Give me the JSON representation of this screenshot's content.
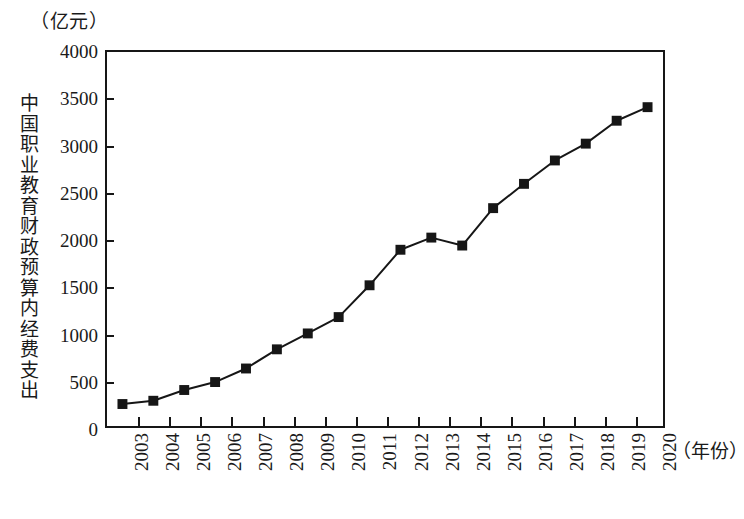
{
  "chart_data": {
    "type": "line",
    "title": "",
    "unit_label": "（亿元）",
    "ylabel": "中国职业教育财政预算内经费支出",
    "xlabel": "（年份）",
    "categories": [
      "2003",
      "2004",
      "2005",
      "2006",
      "2007",
      "2008",
      "2009",
      "2010",
      "2011",
      "2012",
      "2013",
      "2014",
      "2015",
      "2016",
      "2017",
      "2018",
      "2019",
      "2020"
    ],
    "values": [
      235,
      270,
      385,
      470,
      615,
      820,
      990,
      1165,
      1505,
      1885,
      2015,
      1930,
      2330,
      2590,
      2840,
      3020,
      3265,
      3410
    ],
    "ylim": [
      0,
      4000
    ],
    "yticks": [
      0,
      500,
      1000,
      1500,
      2000,
      2500,
      3000,
      3500,
      4000
    ],
    "ytick_labels": [
      "0",
      "500",
      "1000",
      "1500",
      "2000",
      "2500",
      "3000",
      "3500",
      "4000"
    ],
    "grid": false,
    "legend": "none",
    "marker": "filled-square",
    "line_color": "#161616",
    "marker_color": "#161616",
    "frame_color": "#161616"
  },
  "figure": {
    "caption": ""
  }
}
